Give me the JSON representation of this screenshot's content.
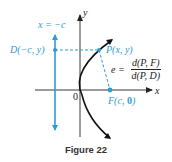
{
  "figure": {
    "caption": "Figure 22",
    "colors": {
      "accent": "#2e9ad6",
      "ink": "#222222"
    }
  },
  "labels": {
    "y_axis": "y",
    "x_axis": "x",
    "origin": "0",
    "directrix": "x = −c",
    "point_d": "D(−c, y)",
    "point_p": "P(x, y)",
    "point_f_prefix": "F(c, ",
    "point_f_zero": "0",
    "point_f_suffix": ")",
    "eccentricity_lhs": "e =",
    "eccentricity_num": "d(P, F)",
    "eccentricity_den": "d(P, D)"
  }
}
